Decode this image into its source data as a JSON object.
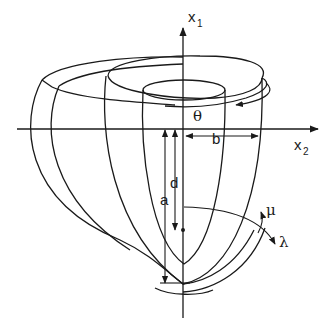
{
  "figure": {
    "colors": {
      "line": "#1a1a1a",
      "background": "#ffffff"
    },
    "axes": {
      "vertical": {
        "label": "x",
        "subscript": "1"
      },
      "horizontal": {
        "label": "x",
        "subscript": "2"
      }
    },
    "labels": {
      "theta": "θ",
      "b": "b",
      "d": "d",
      "a": "a",
      "mu": "μ",
      "lambda": "λ"
    }
  }
}
